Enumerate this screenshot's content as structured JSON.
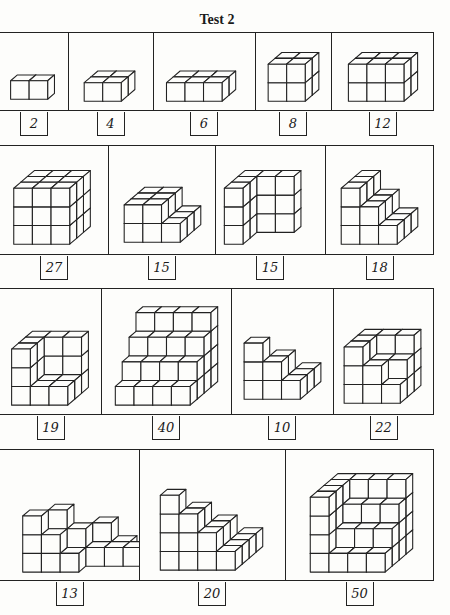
{
  "page": {
    "title": "Test 2"
  },
  "style": {
    "line_color": "#222222",
    "face_color": "#fdfdfb",
    "unit": 19,
    "dx": 7,
    "dy": 6
  },
  "rows": [
    {
      "top": 32,
      "height": 79,
      "panels": [
        {
          "x": 0,
          "w": 68,
          "label": "2",
          "cubes": [
            [
              0,
              0,
              0
            ],
            [
              1,
              0,
              0
            ]
          ],
          "ox": 10,
          "oy": 68
        },
        {
          "x": 68,
          "w": 85,
          "label": "4",
          "cubes": [
            [
              0,
              0,
              0
            ],
            [
              1,
              0,
              0
            ],
            [
              0,
              1,
              0
            ],
            [
              1,
              1,
              0
            ]
          ],
          "ox": 15,
          "oy": 70
        },
        {
          "x": 153,
          "w": 102,
          "label": "6",
          "cubes": [
            [
              0,
              0,
              0
            ],
            [
              1,
              0,
              0
            ],
            [
              2,
              0,
              0
            ],
            [
              0,
              1,
              0
            ],
            [
              1,
              1,
              0
            ],
            [
              2,
              1,
              0
            ]
          ],
          "ox": 12,
          "oy": 70
        },
        {
          "x": 255,
          "w": 76,
          "label": "8",
          "cubes": [
            [
              0,
              0,
              0
            ],
            [
              1,
              0,
              0
            ],
            [
              0,
              1,
              0
            ],
            [
              1,
              1,
              0
            ],
            [
              0,
              0,
              1
            ],
            [
              1,
              0,
              1
            ],
            [
              0,
              1,
              1
            ],
            [
              1,
              1,
              1
            ]
          ],
          "ox": 12,
          "oy": 70
        },
        {
          "x": 331,
          "w": 103,
          "label": "12",
          "cubes": [
            [
              0,
              0,
              0
            ],
            [
              1,
              0,
              0
            ],
            [
              2,
              0,
              0
            ],
            [
              0,
              1,
              0
            ],
            [
              1,
              1,
              0
            ],
            [
              2,
              1,
              0
            ],
            [
              0,
              0,
              1
            ],
            [
              1,
              0,
              1
            ],
            [
              2,
              0,
              1
            ],
            [
              0,
              1,
              1
            ],
            [
              1,
              1,
              1
            ],
            [
              2,
              1,
              1
            ]
          ],
          "ox": 16,
          "oy": 70
        }
      ]
    },
    {
      "top": 145,
      "height": 110,
      "panels": [
        {
          "x": 0,
          "w": 108,
          "label": "27",
          "cubes": "box:3,3,3",
          "ox": 13,
          "oy": 100
        },
        {
          "x": 108,
          "w": 107,
          "label": "15",
          "cubes": [
            [
              0,
              0,
              0
            ],
            [
              1,
              0,
              0
            ],
            [
              2,
              0,
              0
            ],
            [
              0,
              1,
              0
            ],
            [
              1,
              1,
              0
            ],
            [
              2,
              1,
              0
            ],
            [
              0,
              2,
              0
            ],
            [
              1,
              2,
              0
            ],
            [
              2,
              2,
              0
            ],
            [
              0,
              0,
              1
            ],
            [
              1,
              0,
              1
            ],
            [
              0,
              1,
              1
            ],
            [
              1,
              1,
              1
            ],
            [
              0,
              2,
              1
            ],
            [
              1,
              2,
              1
            ]
          ],
          "ox": 15,
          "oy": 98
        },
        {
          "x": 215,
          "w": 110,
          "label": "15",
          "cubes": [
            [
              0,
              0,
              0
            ],
            [
              0,
              0,
              1
            ],
            [
              0,
              0,
              2
            ],
            [
              0,
              1,
              0
            ],
            [
              0,
              1,
              1
            ],
            [
              0,
              1,
              2
            ],
            [
              0,
              2,
              0
            ],
            [
              0,
              2,
              1
            ],
            [
              0,
              2,
              2
            ],
            [
              1,
              2,
              0
            ],
            [
              1,
              2,
              1
            ],
            [
              1,
              2,
              2
            ],
            [
              2,
              2,
              0
            ],
            [
              2,
              2,
              1
            ],
            [
              2,
              2,
              2
            ]
          ],
          "ox": 8,
          "oy": 100
        },
        {
          "x": 325,
          "w": 109,
          "label": "18",
          "cubes": [
            [
              0,
              0,
              0
            ],
            [
              1,
              0,
              0
            ],
            [
              2,
              0,
              0
            ],
            [
              0,
              1,
              0
            ],
            [
              1,
              1,
              0
            ],
            [
              2,
              1,
              0
            ],
            [
              0,
              2,
              0
            ],
            [
              1,
              2,
              0
            ],
            [
              2,
              2,
              0
            ],
            [
              0,
              0,
              1
            ],
            [
              1,
              0,
              1
            ],
            [
              0,
              1,
              1
            ],
            [
              1,
              1,
              1
            ],
            [
              0,
              2,
              1
            ],
            [
              1,
              2,
              1
            ],
            [
              0,
              0,
              2
            ],
            [
              0,
              1,
              2
            ],
            [
              0,
              2,
              2
            ]
          ],
          "ox": 15,
          "oy": 100
        }
      ]
    },
    {
      "top": 288,
      "height": 127,
      "panels": [
        {
          "x": 0,
          "w": 101,
          "label": "19",
          "cubes": [
            [
              0,
              0,
              0
            ],
            [
              1,
              0,
              0
            ],
            [
              2,
              0,
              0
            ],
            [
              0,
              1,
              0
            ],
            [
              1,
              1,
              0
            ],
            [
              2,
              1,
              0
            ],
            [
              0,
              2,
              0
            ],
            [
              1,
              2,
              0
            ],
            [
              2,
              2,
              0
            ],
            [
              0,
              0,
              1
            ],
            [
              0,
              1,
              1
            ],
            [
              0,
              2,
              1
            ],
            [
              1,
              2,
              1
            ],
            [
              2,
              2,
              1
            ],
            [
              0,
              0,
              2
            ],
            [
              0,
              1,
              2
            ],
            [
              0,
              2,
              2
            ],
            [
              1,
              2,
              2
            ],
            [
              2,
              2,
              2
            ]
          ],
          "ox": 11,
          "oy": 118
        },
        {
          "x": 101,
          "w": 130,
          "label": "40",
          "cubes": "stairs:4,4",
          "ox": 13,
          "oy": 118
        },
        {
          "x": 231,
          "w": 102,
          "label": "10",
          "cubes": "pyramid:3",
          "ox": 12,
          "oy": 112
        },
        {
          "x": 333,
          "w": 101,
          "label": "22",
          "cubes": [
            [
              0,
              0,
              0
            ],
            [
              1,
              0,
              0
            ],
            [
              2,
              0,
              0
            ],
            [
              0,
              1,
              0
            ],
            [
              1,
              1,
              0
            ],
            [
              2,
              1,
              0
            ],
            [
              0,
              2,
              0
            ],
            [
              1,
              2,
              0
            ],
            [
              2,
              2,
              0
            ],
            [
              0,
              0,
              1
            ],
            [
              1,
              0,
              1
            ],
            [
              0,
              1,
              1
            ],
            [
              1,
              1,
              1
            ],
            [
              2,
              1,
              1
            ],
            [
              0,
              2,
              1
            ],
            [
              1,
              2,
              1
            ],
            [
              2,
              2,
              1
            ],
            [
              0,
              0,
              2
            ],
            [
              0,
              1,
              2
            ],
            [
              1,
              2,
              2
            ],
            [
              2,
              2,
              2
            ],
            [
              0,
              2,
              2
            ]
          ],
          "ox": 10,
          "oy": 116
        }
      ]
    },
    {
      "top": 449,
      "height": 132,
      "panels": [
        {
          "x": 0,
          "w": 139,
          "label": "13",
          "cubes": [
            [
              0,
              0,
              0
            ],
            [
              1,
              0,
              0
            ],
            [
              2,
              0,
              0
            ],
            [
              3,
              1,
              0
            ],
            [
              4,
              1,
              0
            ],
            [
              5,
              1,
              0
            ],
            [
              0,
              0,
              1
            ],
            [
              1,
              0,
              1
            ],
            [
              2,
              1,
              1
            ],
            [
              3,
              2,
              1
            ],
            [
              0,
              0,
              2
            ],
            [
              1,
              1,
              2
            ],
            [
              4,
              2,
              0
            ]
          ],
          "ox": 22,
          "oy": 124
        },
        {
          "x": 139,
          "w": 146,
          "label": "20",
          "cubes": "pyramid:4",
          "ox": 20,
          "oy": 122
        },
        {
          "x": 285,
          "w": 149,
          "label": "50",
          "cubes": "step50",
          "ox": 24,
          "oy": 124
        }
      ]
    }
  ],
  "labels_meta": {
    "label_top_offset": 2
  }
}
